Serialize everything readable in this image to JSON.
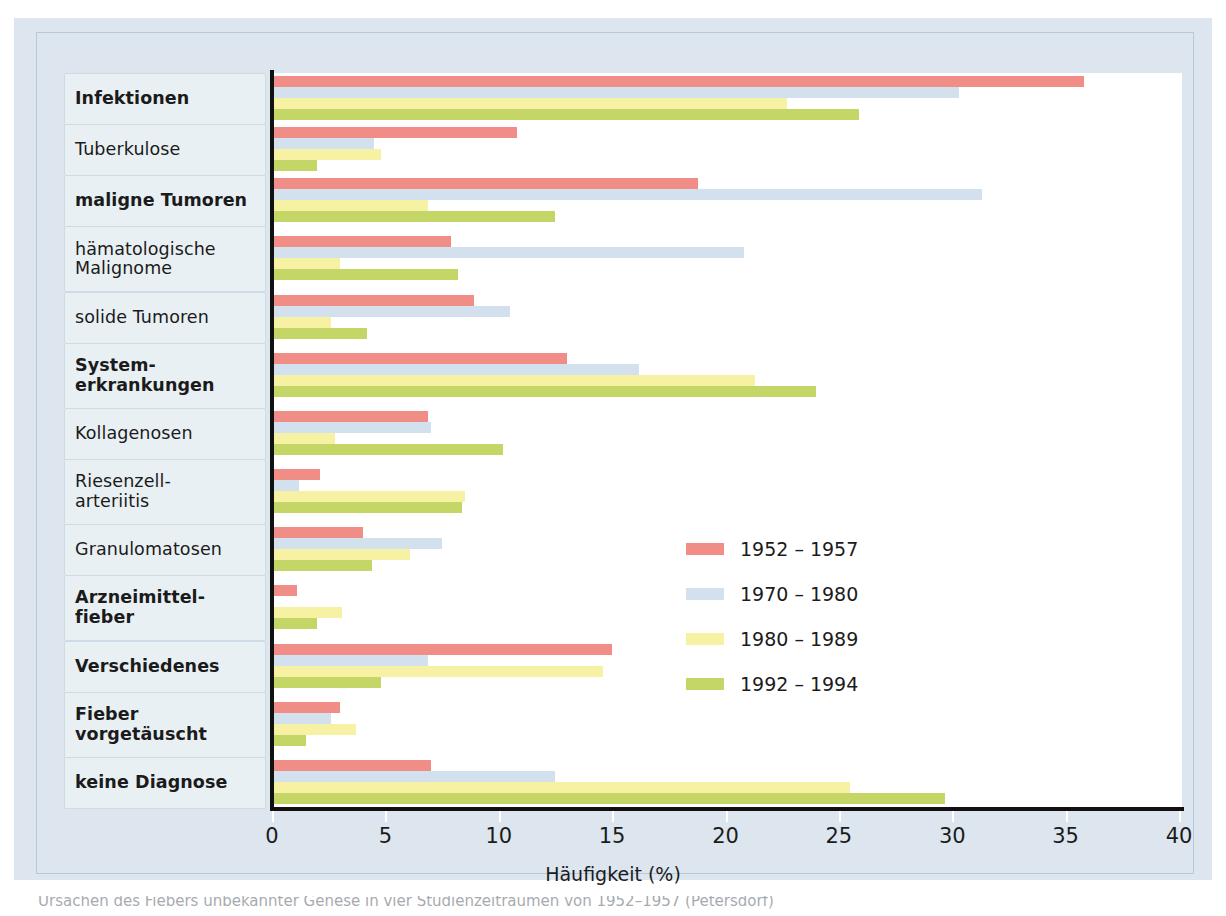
{
  "figure": {
    "x_axis_title": "Häufigkeit (%)",
    "caption": "Ursachen des Fiebers unbekannter Genese in vier Studienzeiträumen von 1952–1957 (Petersdorf)"
  },
  "legend": {
    "position": "middle-right",
    "items": [
      {
        "label": "1952 – 1957",
        "color": "#ef8d86"
      },
      {
        "label": "1970 – 1980",
        "color": "#d3e0ee"
      },
      {
        "label": "1980 – 1989",
        "color": "#f7f2a3"
      },
      {
        "label": "1992 – 1994",
        "color": "#c4d766"
      }
    ]
  },
  "axis": {
    "ticks": [
      0,
      5,
      10,
      15,
      20,
      25,
      30,
      35,
      40
    ],
    "tick_labels": [
      "0",
      "5",
      "10",
      "15",
      "20",
      "25",
      "30",
      "35",
      "40"
    ],
    "min": 0,
    "max": 40
  },
  "chart_data": {
    "type": "bar",
    "orientation": "horizontal",
    "title": "",
    "xlabel": "Häufigkeit (%)",
    "ylabel": "",
    "xlim": [
      0,
      40
    ],
    "grid": false,
    "legend_position": "middle-right",
    "categories": [
      "Infektionen",
      "Tuberkulose",
      "maligne Tumoren",
      "hämatologische Malignome",
      "solide Tumoren",
      "System-erkrankungen",
      "Kollagenosen",
      "Riesenzell-arteriitis",
      "Granulomatosen",
      "Arzneimittel-fieber",
      "Verschiedenes",
      "Fieber vorgetäuscht",
      "keine Diagnose"
    ],
    "series": [
      {
        "name": "1952 – 1957",
        "color": "#ef8d86",
        "values": [
          35.8,
          10.8,
          18.8,
          7.9,
          8.9,
          13.0,
          6.9,
          2.1,
          4.0,
          1.1,
          15.0,
          3.0,
          7.0
        ]
      },
      {
        "name": "1970 – 1980",
        "color": "#d3e0ee",
        "values": [
          30.3,
          4.5,
          31.3,
          20.8,
          10.5,
          16.2,
          7.0,
          1.2,
          7.5,
          0.0,
          6.9,
          2.6,
          12.5
        ]
      },
      {
        "name": "1980 – 1989",
        "color": "#f7f2a3",
        "values": [
          22.7,
          4.8,
          6.9,
          3.0,
          2.6,
          21.3,
          2.8,
          8.5,
          6.1,
          3.1,
          14.6,
          3.7,
          25.5
        ]
      },
      {
        "name": "1992 – 1994",
        "color": "#c4d766",
        "values": [
          25.9,
          2.0,
          12.5,
          8.2,
          4.2,
          24.0,
          10.2,
          8.4,
          4.4,
          2.0,
          4.8,
          1.5,
          29.7
        ]
      }
    ]
  },
  "category_rows": [
    {
      "lines": [
        "Infektionen"
      ],
      "bold": true
    },
    {
      "lines": [
        "Tuberkulose"
      ],
      "bold": false
    },
    {
      "lines": [
        "maligne Tumoren"
      ],
      "bold": true
    },
    {
      "lines": [
        "hämatologische",
        "Malignome"
      ],
      "bold": false
    },
    {
      "lines": [
        "solide Tumoren"
      ],
      "bold": false
    },
    {
      "lines": [
        "System-",
        "erkrankungen"
      ],
      "bold": true
    },
    {
      "lines": [
        "Kollagenosen"
      ],
      "bold": false
    },
    {
      "lines": [
        "Riesenzell-",
        "arteriitis"
      ],
      "bold": false
    },
    {
      "lines": [
        "Granulomatosen"
      ],
      "bold": false
    },
    {
      "lines": [
        "Arzneimittel-",
        "fieber"
      ],
      "bold": true
    },
    {
      "lines": [
        "Verschiedenes"
      ],
      "bold": true
    },
    {
      "lines": [
        "Fieber",
        "vorgetäuscht"
      ],
      "bold": true
    },
    {
      "lines": [
        "keine Diagnose"
      ],
      "bold": true
    }
  ]
}
